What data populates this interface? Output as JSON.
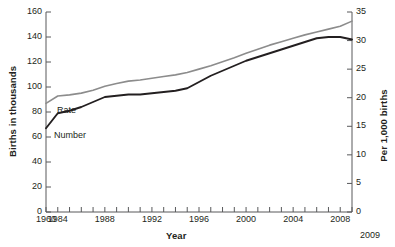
{
  "chart_data": {
    "type": "line",
    "title": "",
    "xlabel": "Year",
    "ylabel": "Births in thousands",
    "ylabel_right": "Per 1,000 births",
    "x": [
      1960,
      1984,
      1985,
      1986,
      1987,
      1988,
      1989,
      1990,
      1991,
      1992,
      1993,
      1994,
      1995,
      1996,
      1997,
      1998,
      1999,
      2000,
      2001,
      2002,
      2003,
      2004,
      2005,
      2006,
      2007,
      2008,
      2009
    ],
    "xtick_labels": [
      "1960",
      "1984",
      "1988",
      "1992",
      "1996",
      "2000",
      "2004",
      "2008"
    ],
    "xtick_years": [
      1960,
      1984,
      1988,
      1992,
      1996,
      2000,
      2004,
      2008
    ],
    "end_year_label": "2009",
    "ylim_left": [
      0,
      160
    ],
    "ytick_labels_left": [
      "0",
      "20",
      "40",
      "60",
      "80",
      "100",
      "120",
      "140",
      "160"
    ],
    "ytick_values_left": [
      0,
      20,
      40,
      60,
      80,
      100,
      120,
      140,
      160
    ],
    "ylim_right": [
      0,
      35
    ],
    "ytick_labels_right": [
      "0",
      "5",
      "10",
      "15",
      "20",
      "25",
      "30",
      "35"
    ],
    "ytick_values_right": [
      0,
      5,
      10,
      15,
      20,
      25,
      30,
      35
    ],
    "grid": false,
    "legend_position": "inline-labels",
    "series": [
      {
        "name": "Number",
        "label": "Number",
        "axis": "left",
        "color": "#231f20",
        "unit": "thousands of births",
        "values": [
          67,
          79,
          81,
          84,
          88,
          92,
          93,
          94,
          94,
          95,
          96,
          97,
          99,
          104,
          109,
          113,
          117,
          121,
          124,
          127,
          130,
          133,
          136,
          139,
          140,
          140,
          138
        ]
      },
      {
        "name": "Rate",
        "label": "Rate",
        "axis": "right",
        "color": "#8c8c8c",
        "unit": "per 1,000 births",
        "values": [
          19.0,
          20.3,
          20.5,
          20.8,
          21.3,
          22.0,
          22.5,
          22.9,
          23.1,
          23.4,
          23.7,
          24.0,
          24.4,
          25.0,
          25.6,
          26.3,
          27.0,
          27.8,
          28.5,
          29.2,
          29.8,
          30.4,
          31.0,
          31.5,
          32.0,
          32.5,
          33.4
        ]
      }
    ]
  }
}
